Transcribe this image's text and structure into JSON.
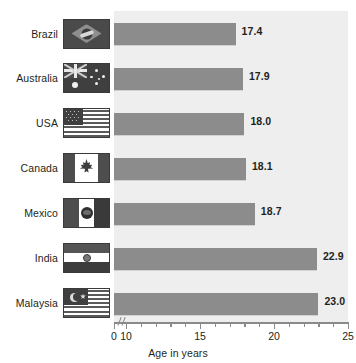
{
  "chart_data": {
    "type": "bar",
    "orientation": "horizontal",
    "title": "",
    "xlabel": "Age in years",
    "ylabel": "",
    "categories": [
      "Brazil",
      "Australia",
      "USA",
      "Canada",
      "Mexico",
      "India",
      "Malaysia"
    ],
    "values": [
      17.4,
      17.9,
      18.0,
      18.1,
      18.7,
      22.9,
      23.0
    ],
    "value_labels": [
      "17.4",
      "17.9",
      "18.0",
      "18.1",
      "18.7",
      "22.9",
      "23.0"
    ],
    "xlim": [
      0,
      25
    ],
    "axis_break": true,
    "axis_break_after": 0,
    "axis_major_ticks": [
      0,
      10,
      15,
      20,
      25
    ],
    "axis_tick_labels": [
      "0",
      "10",
      "15",
      "20",
      "25"
    ],
    "axis_minor_ticks": [
      11,
      12,
      13,
      14,
      16,
      17,
      18,
      19,
      21,
      22,
      23,
      24
    ],
    "grid": false,
    "legend": "none",
    "bar_color": "#8c8c8c",
    "plot_background": "#eeeeee",
    "text_color": "#231f20",
    "axis_color": "#8a8a8a"
  },
  "flags": [
    {
      "country": "Brazil",
      "icon": "flag-brazil-icon"
    },
    {
      "country": "Australia",
      "icon": "flag-australia-icon"
    },
    {
      "country": "USA",
      "icon": "flag-usa-icon"
    },
    {
      "country": "Canada",
      "icon": "flag-canada-icon"
    },
    {
      "country": "Mexico",
      "icon": "flag-mexico-icon"
    },
    {
      "country": "India",
      "icon": "flag-india-icon"
    },
    {
      "country": "Malaysia",
      "icon": "flag-malaysia-icon"
    }
  ]
}
